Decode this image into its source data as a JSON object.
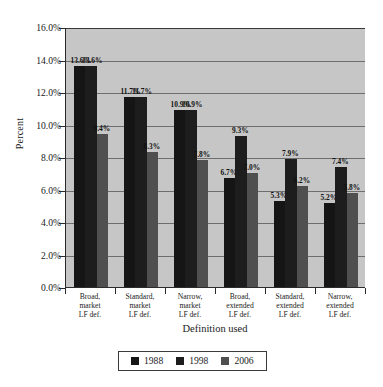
{
  "chart_data": {
    "type": "bar",
    "title": "",
    "subtitle": "",
    "xlabel": "Definition used",
    "ylabel": "Percent",
    "ylim": [
      0,
      16
    ],
    "ytick_labels": [
      "0.0%",
      "2.0%",
      "4.0%",
      "6.0%",
      "8.0%",
      "10.0%",
      "12.0%",
      "14.0%",
      "16.0%"
    ],
    "ytick_values": [
      0,
      2,
      4,
      6,
      8,
      10,
      12,
      14,
      16
    ],
    "grid": "horizontal",
    "legend_position": "bottom",
    "categories": [
      "Broad,\nmarket\nLF def.",
      "Standard,\nmarket\nLF def.",
      "Narrow,\nmarket\nLF def.",
      "Broad,\nextended\nLF def.",
      "Standard,\nextended\nLF def.",
      "Narrow,\nextended\nLF def."
    ],
    "series": [
      {
        "name": "1988",
        "color": "#151515",
        "values": [
          13.6,
          11.7,
          10.9,
          6.7,
          5.3,
          5.2
        ],
        "value_labels": [
          "13.6%",
          "11.7%",
          "10.9%",
          "6.7%",
          "5.3%",
          "5.2%"
        ]
      },
      {
        "name": "1998",
        "color": "#1d1d1d",
        "values": [
          13.6,
          11.7,
          10.9,
          9.3,
          7.9,
          7.4
        ],
        "value_labels": [
          "13.6%",
          "11.7%",
          "10.9%",
          "9.3%",
          "7.9%",
          "7.4%"
        ]
      },
      {
        "name": "2006",
        "color": "#4f4f4f",
        "values": [
          9.4,
          8.3,
          7.8,
          7.0,
          6.2,
          5.8
        ],
        "value_labels": [
          "9.4%",
          "8.3%",
          "7.8%",
          "7.0%",
          "6.2%",
          "5.8%"
        ]
      }
    ],
    "legend_entries": [
      "1988",
      "1998",
      "2006"
    ]
  }
}
